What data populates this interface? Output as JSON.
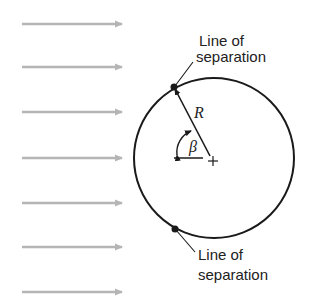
{
  "figure": {
    "flow_arrows": {
      "count": 7,
      "color": "#b5b5b5",
      "y_positions": [
        24,
        67,
        112,
        158,
        203,
        247,
        292
      ]
    },
    "cylinder": {
      "stroke": "#1a1a1a"
    },
    "labels": {
      "top_line1": "Line of",
      "top_line2": "separation",
      "bottom_line1": "Line of",
      "bottom_line2": "separation",
      "radius": "R",
      "angle": "β",
      "center": "+"
    }
  }
}
